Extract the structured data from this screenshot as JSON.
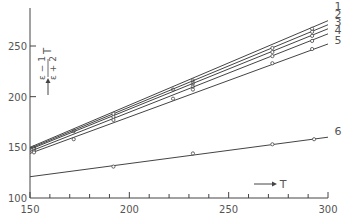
{
  "chart_data": {
    "type": "line",
    "title": "",
    "xlabel": "T",
    "ylabel": "(ε−1)/(ε+2) T",
    "xlim": [
      150,
      300
    ],
    "ylim": [
      100,
      280
    ],
    "x_ticks": [
      150,
      200,
      250,
      300
    ],
    "y_ticks": [
      100,
      150,
      200,
      250
    ],
    "grid": false,
    "legend": "inline labels at right end of lines",
    "series": [
      {
        "name": "1",
        "x": [
          150,
          300
        ],
        "values": [
          150,
          275
        ],
        "points": [
          [
            152,
            150
          ],
          [
            172,
            166
          ],
          [
            222,
            207
          ],
          [
            232,
            216
          ],
          [
            292,
            267
          ]
        ]
      },
      {
        "name": "2",
        "x": [
          150,
          300
        ],
        "values": [
          149,
          271
        ],
        "points": [
          [
            152,
            149
          ],
          [
            192,
            183
          ],
          [
            232,
            213
          ],
          [
            272,
            248
          ],
          [
            292,
            264
          ]
        ]
      },
      {
        "name": "3",
        "x": [
          150,
          300
        ],
        "values": [
          148,
          267
        ],
        "points": [
          [
            152,
            148
          ],
          [
            192,
            180
          ],
          [
            232,
            210
          ],
          [
            272,
            244
          ],
          [
            292,
            260
          ]
        ]
      },
      {
        "name": "4",
        "x": [
          150,
          300
        ],
        "values": [
          146,
          262
        ],
        "points": [
          [
            152,
            146
          ],
          [
            192,
            177
          ],
          [
            232,
            207
          ],
          [
            272,
            240
          ],
          [
            292,
            255
          ]
        ]
      },
      {
        "name": "5",
        "x": [
          150,
          300
        ],
        "values": [
          144,
          252
        ],
        "points": [
          [
            152,
            145
          ],
          [
            172,
            158
          ],
          [
            222,
            198
          ],
          [
            272,
            233
          ],
          [
            292,
            247
          ]
        ]
      },
      {
        "name": "6",
        "x": [
          150,
          300
        ],
        "values": [
          121,
          160
        ],
        "points": [
          [
            192,
            131
          ],
          [
            232,
            144
          ],
          [
            272,
            153
          ],
          [
            293,
            158
          ]
        ]
      }
    ]
  },
  "axes": {
    "x_tick_labels": [
      "150",
      "200",
      "250",
      "300"
    ],
    "y_tick_labels": [
      "100",
      "150",
      "200",
      "250"
    ],
    "x_axis_label": "T",
    "y_axis_label_numerator": "ε − 1",
    "y_axis_label_denominator": "ε + 2",
    "y_axis_label_suffix": "T"
  },
  "line_labels": [
    "1",
    "2",
    "3",
    "4",
    "5",
    "6"
  ]
}
